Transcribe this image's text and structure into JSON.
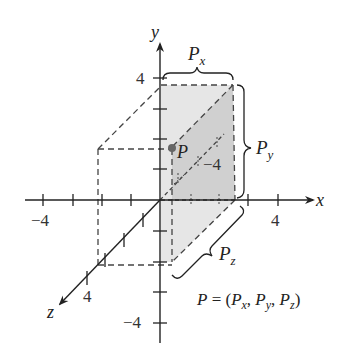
{
  "diagram": {
    "axes": {
      "x_label": "x",
      "y_label": "y",
      "z_label": "z"
    },
    "tick_labels": {
      "x_neg": "−4",
      "x_pos": "4",
      "y_pos": "4",
      "y_neg": "−4",
      "z_pos": "4",
      "z_neg": "−4"
    },
    "point": {
      "label": "P",
      "color": "#666666"
    },
    "components": {
      "px_base": "P",
      "px_sub": "x",
      "py_base": "P",
      "py_sub": "y",
      "pz_base": "P",
      "pz_sub": "z"
    },
    "equation": {
      "lhs": "P",
      "eq": " = (",
      "p1": "P",
      "s1": "x",
      "c1": ", ",
      "p2": "P",
      "s2": "y",
      "c2": ", ",
      "p3": "P",
      "s3": "z",
      "close": ")"
    },
    "colors": {
      "axis": "#222222",
      "face_light": "#e4e4e4",
      "face_dark": "#cfcfcf",
      "dashed": "#444444"
    }
  }
}
